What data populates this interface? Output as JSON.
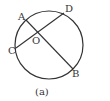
{
  "diagram": {
    "type": "circle-chords",
    "points": {
      "A": {
        "label": "A"
      },
      "B": {
        "label": "B"
      },
      "C": {
        "label": "C"
      },
      "D": {
        "label": "D"
      },
      "O": {
        "label": "O"
      }
    },
    "chords": [
      "AB",
      "CD"
    ],
    "caption": "(a)",
    "stroke_color": "#333333"
  }
}
